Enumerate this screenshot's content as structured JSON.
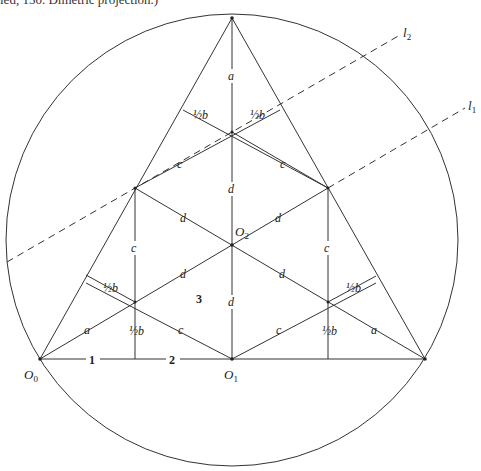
{
  "caption": "ied, 150. Dimetric projection.)",
  "diagram": {
    "type": "geometric construction",
    "circle": {
      "cx": 232,
      "cy": 240,
      "r": 226
    },
    "triangle": {
      "apex": [
        232,
        18
      ],
      "left": [
        40,
        359
      ],
      "right": [
        425,
        359
      ]
    },
    "points": {
      "O0": {
        "label": "O",
        "sub": "0"
      },
      "O1": {
        "label": "O",
        "sub": "1"
      },
      "O2": {
        "label": "O",
        "sub": "2"
      }
    },
    "lines": {
      "l1": {
        "label": "l",
        "sub": "1"
      },
      "l2": {
        "label": "l",
        "sub": "2"
      }
    },
    "segment_labels": {
      "a": "a",
      "c": "c",
      "d": "d",
      "half_b": "½b"
    },
    "region_labels": {
      "one": "1",
      "two": "2",
      "three": "3"
    }
  }
}
